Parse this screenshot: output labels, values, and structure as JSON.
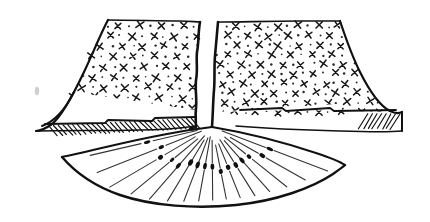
{
  "image": {
    "title": "Draped curtain panels with pleated fan",
    "subject": "line-drawing-garment-drape",
    "background_color": "#ffffff",
    "ink_color": "#111111",
    "width": 430,
    "height": 222
  },
  "palette": {
    "ink": "#111111",
    "ink_soft": "#333333",
    "motif": "#151515",
    "motif_dot": "#2a2a2a",
    "paper": "#ffffff",
    "speck": "#cfcfcf"
  },
  "scene": {
    "apex": {
      "x": 212,
      "y": 127
    },
    "stray_speck": {
      "x": 37,
      "y": 91,
      "rx": 2.2,
      "ry": 4.2
    }
  },
  "left_panel": {
    "name": "left curtain panel",
    "outline": "M 108 20 C 100 34 88 62 74 90 C 64 110 54 124 36 131 L 150 131 L 196 126 C 196 100 198 62 200 22 Z",
    "outer_edge": "M 108 20 C 100 34 88 62 74 90 C 64 110 54 124 36 131",
    "top_edge": "M 108 20 L 200 22",
    "inner_edge": "M 200 22 C 199 40 197 64 197 88 C 197 104 197 116 196 126",
    "hem_top": "M 36 131 L 150 130 L 196 126",
    "hem_band": "M 36 131 C 52 126 64 112 74 92 L 196 110 C 196 116 196 121 196 126 L 150 130 Z",
    "hem_seam": "M 45 125 L 152 122 L 196 118",
    "hatch_count": 24,
    "motif_rows": 8,
    "motif_cols": 7
  },
  "right_panel": {
    "name": "right curtain panel",
    "outline": "M 218 22 L 340 21 C 346 40 356 70 370 92 C 382 108 392 114 402 112 L 268 116 L 212 127 Z",
    "outer_edge": "M 340 21 C 346 40 356 70 370 92 C 382 108 392 114 402 112",
    "top_edge": "M 218 22 L 340 21",
    "inner_edge": "M 218 22 C 217 46 215 76 214 100 C 213 112 213 121 212 127",
    "hem_top": "M 214 112 L 300 110 L 402 112",
    "hem_band": "M 214 112 L 336 104 C 350 117 372 128 402 131 L 402 112 L 300 110 Z",
    "hem_seam": "M 240 108 L 330 105 L 396 108",
    "hatch_count": 30,
    "motif_rows": 8,
    "motif_cols": 9
  },
  "fan": {
    "name": "pleated fan drape",
    "outline": "M 212 127 C 170 132 110 144 62 157 C 76 172 98 190 130 199 C 170 210 222 209 266 198 C 302 189 328 177 345 165 C 310 150 262 134 212 127 Z",
    "left_tip": {
      "x": 62,
      "y": 157
    },
    "right_tip": {
      "x": 345,
      "y": 165
    },
    "bottom_sag_y": 205,
    "pleat_line_count": 17,
    "bead_count": 17
  },
  "annotations": {
    "left_panel_label": "left panel",
    "right_panel_label": "right panel",
    "fan_label": "fan drape",
    "apex_label": "gather point"
  }
}
